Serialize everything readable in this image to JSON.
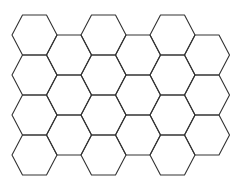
{
  "diagram": {
    "type": "hexagonal-grid",
    "orientation": "flat-top",
    "background": "#ffffff",
    "stroke_color": "#333333",
    "hex": {
      "width": 45,
      "height": 40,
      "vertex_inset": 10.5
    },
    "grid": {
      "origin_x": 12,
      "origin_y": 15,
      "column_pitch": 34.5,
      "row_pitch": 40,
      "odd_column_offset_y": 20
    },
    "columns": [
      {
        "index": 0,
        "count": 4
      },
      {
        "index": 1,
        "count": 3
      },
      {
        "index": 2,
        "count": 4
      },
      {
        "index": 3,
        "count": 3
      },
      {
        "index": 4,
        "count": 4
      },
      {
        "index": 5,
        "count": 3
      }
    ],
    "total_cells": 21
  }
}
